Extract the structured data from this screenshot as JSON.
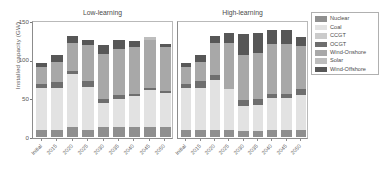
{
  "chart_data": {
    "type": "bar",
    "title": "",
    "xlabel": "",
    "ylabel": "Installed capacity (GW)",
    "ylim": [
      0,
      150
    ],
    "yticks": [
      0,
      50,
      100,
      150
    ],
    "ytick_labels": [
      "0",
      "50",
      "100",
      "150"
    ],
    "grid": false,
    "stacked": true,
    "legend_position": "right",
    "legend_entries": [
      "Nuclear",
      "Coal",
      "CCGT",
      "OCGT",
      "Wind-Onshore",
      "Solar",
      "Wind-Offshore"
    ],
    "series_colors": [
      "#8f8f8f",
      "#e2e2e2",
      "#cbcbcb",
      "#6e6e6e",
      "#a8a8a8",
      "#bdbdbd",
      "#575757"
    ],
    "panels": [
      {
        "title": "Low-learning",
        "categories": [
          "Initial",
          "2015",
          "2020",
          "2025",
          "2030",
          "2035",
          "2040",
          "2045",
          "2050"
        ],
        "series": [
          {
            "name": "Nuclear",
            "values": [
              9,
              9,
              13,
              9,
              13,
              13,
              13,
              13,
              13
            ]
          },
          {
            "name": "Coal",
            "values": [
              54,
              54,
              68,
              56,
              31,
              36,
              40,
              48,
              44
            ]
          },
          {
            "name": "CCGT",
            "values": [
              0,
              0,
              0,
              0,
              0,
              0,
              0,
              0,
              0
            ]
          },
          {
            "name": "OCGT",
            "values": [
              5,
              8,
              5,
              7,
              5,
              5,
              3,
              3,
              3
            ]
          },
          {
            "name": "Wind-Onshore",
            "values": [
              23,
              26,
              36,
              47,
              58,
              60,
              60,
              62,
              56
            ]
          },
          {
            "name": "Solar",
            "values": [
              0,
              0,
              0,
              0,
              0,
              0,
              0,
              4,
              0
            ]
          },
          {
            "name": "Wind-Offshore",
            "values": [
              5,
              9,
              9,
              7,
              12,
              12,
              8,
              0,
              4
            ]
          }
        ],
        "totals": [
          96,
          106,
          131,
          126,
          119,
          126,
          124,
          130,
          120
        ]
      },
      {
        "title": "High-learning",
        "categories": [
          "Initial",
          "2015",
          "2020",
          "2025",
          "2030",
          "2035",
          "2040",
          "2045",
          "2050"
        ],
        "series": [
          {
            "name": "Nuclear",
            "values": [
              9,
              9,
              9,
              9,
              8,
              8,
              9,
              9,
              9
            ]
          },
          {
            "name": "Coal",
            "values": [
              54,
              54,
              65,
              53,
              32,
              33,
              42,
              42,
              45
            ]
          },
          {
            "name": "CCGT",
            "values": [
              0,
              0,
              0,
              0,
              0,
              0,
              0,
              0,
              0
            ]
          },
          {
            "name": "OCGT",
            "values": [
              5,
              9,
              6,
              0,
              8,
              8,
              5,
              5,
              8
            ]
          },
          {
            "name": "Wind-Onshore",
            "values": [
              23,
              25,
              42,
              60,
              58,
              60,
              64,
              64,
              56
            ]
          },
          {
            "name": "Solar",
            "values": [
              0,
              0,
              0,
              0,
              0,
              0,
              0,
              0,
              0
            ]
          },
          {
            "name": "Wind-Offshore",
            "values": [
              5,
              9,
              9,
              12,
              27,
              26,
              18,
              18,
              12
            ]
          }
        ],
        "totals": [
          96,
          106,
          131,
          134,
          133,
          135,
          138,
          138,
          130
        ]
      }
    ]
  },
  "legend": {
    "items": [
      {
        "label": "Nuclear",
        "color": "#8f8f8f"
      },
      {
        "label": "Coal",
        "color": "#e2e2e2"
      },
      {
        "label": "CCGT",
        "color": "#cbcbcb"
      },
      {
        "label": "OCGT",
        "color": "#6e6e6e"
      },
      {
        "label": "Wind-Onshore",
        "color": "#a8a8a8"
      },
      {
        "label": "Solar",
        "color": "#bdbdbd"
      },
      {
        "label": "Wind-Offshore",
        "color": "#575757"
      }
    ]
  }
}
